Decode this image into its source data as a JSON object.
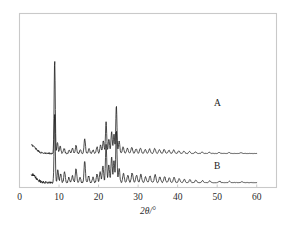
{
  "figure": {
    "background_color": "#ffffff",
    "frame_color": "#c9c9c9",
    "trace_color": "#111111"
  },
  "axis": {
    "x_title": "2θ/°",
    "x_ticks": [
      "0",
      "10",
      "20",
      "30",
      "40",
      "50",
      "60"
    ],
    "x_tick_values": [
      0,
      10,
      20,
      30,
      40,
      50,
      60
    ],
    "y_title": "",
    "y_ticks": []
  },
  "labels": {
    "curve_a": "A",
    "curve_b": "B"
  },
  "chart_data": {
    "type": "line",
    "title": "",
    "subtitle": "",
    "xlabel": "2θ/°",
    "ylabel": "Intensity (a.u.)",
    "xlim": [
      0,
      65
    ],
    "ylim": [
      0,
      100
    ],
    "grid": false,
    "legend": "inline-right",
    "annotations": [
      {
        "text": "A",
        "x": 47,
        "y": 42
      },
      {
        "text": "B",
        "x": 47,
        "y": 13
      }
    ],
    "series": [
      {
        "name": "A",
        "baseline": 21,
        "x_start": 3.0,
        "x_end": 60.0,
        "peaks": [
          {
            "x": 8.9,
            "h": 58.0,
            "w": 0.2
          },
          {
            "x": 9.6,
            "h": 7.0,
            "w": 0.22
          },
          {
            "x": 10.3,
            "h": 4.5,
            "w": 0.25
          },
          {
            "x": 11.3,
            "h": 3.0,
            "w": 0.25
          },
          {
            "x": 12.6,
            "h": 2.2,
            "w": 0.25
          },
          {
            "x": 13.4,
            "h": 3.4,
            "w": 0.25
          },
          {
            "x": 14.3,
            "h": 5.0,
            "w": 0.25
          },
          {
            "x": 15.4,
            "h": 2.4,
            "w": 0.25
          },
          {
            "x": 16.5,
            "h": 9.2,
            "w": 0.25
          },
          {
            "x": 17.6,
            "h": 3.0,
            "w": 0.25
          },
          {
            "x": 18.6,
            "h": 2.2,
            "w": 0.25
          },
          {
            "x": 19.6,
            "h": 4.0,
            "w": 0.25
          },
          {
            "x": 20.5,
            "h": 5.2,
            "w": 0.25
          },
          {
            "x": 21.2,
            "h": 8.0,
            "w": 0.25
          },
          {
            "x": 21.9,
            "h": 19.5,
            "w": 0.22
          },
          {
            "x": 22.6,
            "h": 9.0,
            "w": 0.24
          },
          {
            "x": 23.3,
            "h": 13.5,
            "w": 0.24
          },
          {
            "x": 23.9,
            "h": 12.0,
            "w": 0.22
          },
          {
            "x": 24.5,
            "h": 29.5,
            "w": 0.22
          },
          {
            "x": 25.2,
            "h": 7.5,
            "w": 0.25
          },
          {
            "x": 26.2,
            "h": 4.0,
            "w": 0.28
          },
          {
            "x": 27.3,
            "h": 3.2,
            "w": 0.3
          },
          {
            "x": 28.4,
            "h": 3.6,
            "w": 0.3
          },
          {
            "x": 29.5,
            "h": 3.0,
            "w": 0.3
          },
          {
            "x": 30.6,
            "h": 3.4,
            "w": 0.3
          },
          {
            "x": 31.8,
            "h": 2.4,
            "w": 0.3
          },
          {
            "x": 32.9,
            "h": 2.8,
            "w": 0.3
          },
          {
            "x": 34.2,
            "h": 3.2,
            "w": 0.3
          },
          {
            "x": 35.4,
            "h": 2.4,
            "w": 0.3
          },
          {
            "x": 36.6,
            "h": 2.6,
            "w": 0.3
          },
          {
            "x": 37.8,
            "h": 2.0,
            "w": 0.3
          },
          {
            "x": 39.0,
            "h": 2.2,
            "w": 0.3
          },
          {
            "x": 40.3,
            "h": 1.6,
            "w": 0.3
          },
          {
            "x": 41.6,
            "h": 1.4,
            "w": 0.3
          },
          {
            "x": 43.0,
            "h": 1.2,
            "w": 0.3
          },
          {
            "x": 44.5,
            "h": 1.0,
            "w": 0.3
          },
          {
            "x": 46.2,
            "h": 0.9,
            "w": 0.3
          },
          {
            "x": 48.0,
            "h": 0.8,
            "w": 0.3
          },
          {
            "x": 50.5,
            "h": 0.7,
            "w": 0.3
          },
          {
            "x": 53.0,
            "h": 0.6,
            "w": 0.3
          },
          {
            "x": 56.0,
            "h": 0.5,
            "w": 0.3
          }
        ],
        "noise": 0.55,
        "rise_left": true
      },
      {
        "name": "B",
        "baseline": 3,
        "x_start": 3.0,
        "x_end": 60.0,
        "peaks": [
          {
            "x": 8.9,
            "h": 43.0,
            "w": 0.2
          },
          {
            "x": 9.7,
            "h": 8.0,
            "w": 0.22
          },
          {
            "x": 10.4,
            "h": 5.5,
            "w": 0.25
          },
          {
            "x": 11.4,
            "h": 6.5,
            "w": 0.25
          },
          {
            "x": 12.5,
            "h": 3.0,
            "w": 0.25
          },
          {
            "x": 13.4,
            "h": 4.0,
            "w": 0.25
          },
          {
            "x": 14.3,
            "h": 8.5,
            "w": 0.25
          },
          {
            "x": 15.3,
            "h": 3.2,
            "w": 0.25
          },
          {
            "x": 16.5,
            "h": 13.5,
            "w": 0.24
          },
          {
            "x": 17.5,
            "h": 4.0,
            "w": 0.25
          },
          {
            "x": 18.6,
            "h": 3.2,
            "w": 0.25
          },
          {
            "x": 19.6,
            "h": 5.2,
            "w": 0.25
          },
          {
            "x": 20.4,
            "h": 7.0,
            "w": 0.25
          },
          {
            "x": 21.1,
            "h": 10.5,
            "w": 0.25
          },
          {
            "x": 21.9,
            "h": 24.0,
            "w": 0.22
          },
          {
            "x": 22.6,
            "h": 11.0,
            "w": 0.24
          },
          {
            "x": 23.3,
            "h": 16.0,
            "w": 0.24
          },
          {
            "x": 23.9,
            "h": 14.0,
            "w": 0.22
          },
          {
            "x": 24.5,
            "h": 32.0,
            "w": 0.22
          },
          {
            "x": 25.2,
            "h": 9.0,
            "w": 0.25
          },
          {
            "x": 26.3,
            "h": 5.5,
            "w": 0.28
          },
          {
            "x": 27.4,
            "h": 4.5,
            "w": 0.3
          },
          {
            "x": 28.5,
            "h": 6.0,
            "w": 0.3
          },
          {
            "x": 29.6,
            "h": 4.5,
            "w": 0.3
          },
          {
            "x": 30.7,
            "h": 5.0,
            "w": 0.3
          },
          {
            "x": 31.9,
            "h": 3.5,
            "w": 0.3
          },
          {
            "x": 33.0,
            "h": 4.2,
            "w": 0.3
          },
          {
            "x": 34.3,
            "h": 5.0,
            "w": 0.3
          },
          {
            "x": 35.5,
            "h": 3.4,
            "w": 0.3
          },
          {
            "x": 36.7,
            "h": 3.8,
            "w": 0.3
          },
          {
            "x": 37.9,
            "h": 3.0,
            "w": 0.3
          },
          {
            "x": 39.1,
            "h": 3.2,
            "w": 0.3
          },
          {
            "x": 40.4,
            "h": 2.4,
            "w": 0.3
          },
          {
            "x": 41.7,
            "h": 2.0,
            "w": 0.3
          },
          {
            "x": 43.1,
            "h": 1.8,
            "w": 0.3
          },
          {
            "x": 44.6,
            "h": 1.5,
            "w": 0.3
          },
          {
            "x": 46.3,
            "h": 1.3,
            "w": 0.3
          },
          {
            "x": 48.1,
            "h": 1.1,
            "w": 0.3
          },
          {
            "x": 50.6,
            "h": 0.9,
            "w": 0.3
          },
          {
            "x": 53.1,
            "h": 0.8,
            "w": 0.3
          },
          {
            "x": 56.2,
            "h": 0.6,
            "w": 0.3
          }
        ],
        "noise": 0.8,
        "rise_left": true
      }
    ]
  }
}
